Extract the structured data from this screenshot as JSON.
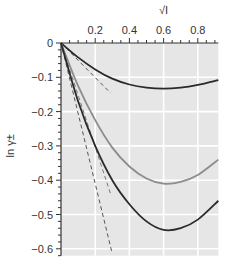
{
  "chart_data": {
    "type": "line",
    "title": "",
    "xlabel": "√I",
    "ylabel": "ln γ±",
    "xlim": [
      0,
      0.92
    ],
    "ylim": [
      -0.62,
      0
    ],
    "x_axis_position": "top",
    "grid": true,
    "legend": null,
    "x_ticks": [
      0.2,
      0.4,
      0.6,
      0.8
    ],
    "x_tick_labels": [
      "0.2",
      "0.4",
      "0.6",
      "0.8"
    ],
    "y_ticks": [
      0,
      -0.1,
      -0.2,
      -0.3,
      -0.4,
      -0.5,
      -0.6
    ],
    "y_tick_labels": [
      "0",
      "−0.1",
      "−0.2",
      "−0.3",
      "−0.4",
      "−0.5",
      "−0.6"
    ],
    "x": [
      0,
      0.1,
      0.2,
      0.3,
      0.4,
      0.5,
      0.6,
      0.7,
      0.8,
      0.92
    ],
    "series": [
      {
        "name": "curve-top",
        "style": "solid",
        "color": "#2a2a2a",
        "values": [
          0,
          -0.042,
          -0.077,
          -0.104,
          -0.121,
          -0.13,
          -0.133,
          -0.13,
          -0.122,
          -0.108
        ]
      },
      {
        "name": "curve-middle",
        "style": "solid",
        "color": "#8c8c8c",
        "values": [
          0,
          -0.125,
          -0.225,
          -0.305,
          -0.36,
          -0.395,
          -0.41,
          -0.405,
          -0.385,
          -0.34
        ]
      },
      {
        "name": "curve-bottom",
        "style": "solid",
        "color": "#2a2a2a",
        "values": [
          0,
          -0.17,
          -0.3,
          -0.4,
          -0.47,
          -0.52,
          -0.545,
          -0.54,
          -0.515,
          -0.46
        ]
      }
    ],
    "limiting_lines": [
      {
        "name": "limit-top",
        "style": "dashed",
        "color": "#555555",
        "x": [
          0,
          0.29
        ],
        "values": [
          0,
          -0.146
        ]
      },
      {
        "name": "limit-middle",
        "style": "dashed",
        "color": "#777777",
        "x": [
          0,
          0.29
        ],
        "values": [
          0,
          -0.44
        ]
      },
      {
        "name": "limit-bottom",
        "style": "dashed",
        "color": "#555555",
        "x": [
          0,
          0.3
        ],
        "values": [
          0,
          -0.615
        ]
      }
    ],
    "colors": {
      "plot_bg": "#e6e6e6",
      "grid": "#ffffff",
      "axis": "#333333"
    }
  }
}
